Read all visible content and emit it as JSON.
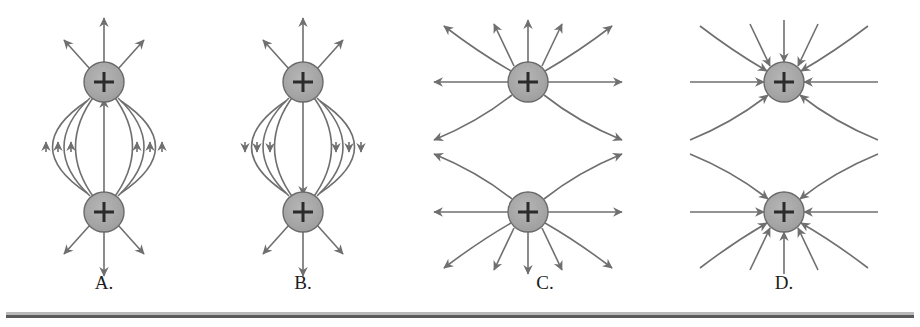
{
  "figure": {
    "background": "#ffffff",
    "line_color": "#6f6f6f",
    "charge_fill": "#a8a8a8",
    "charge_stroke": "#6a6a6a",
    "sign_color": "#2b2b2b",
    "label_color": "#1d1d1d",
    "rule_light_color": "#b9b9b9",
    "rule_dark_color": "#5a5a5a"
  },
  "panels": [
    {
      "id": "A",
      "label": "A.",
      "label_x": 104,
      "label_y": 272,
      "charge_sign": "+",
      "charges": [
        {
          "name": "upper-charge",
          "cx": 104,
          "cy": 82,
          "r": 20,
          "sign": "+"
        },
        {
          "name": "lower-charge",
          "cx": 104,
          "cy": 212,
          "r": 20,
          "sign": "+"
        }
      ],
      "pattern": "connected-arcs",
      "arc_count": 7,
      "middle_arrow_direction": "up",
      "pole_ray_count": 3,
      "top_pole_ray_direction": "outward-up",
      "bottom_pole_ray_direction": "outward-down",
      "description": "Curved arcs join the two charges; arrows along the arcs point upward."
    },
    {
      "id": "B",
      "label": "B.",
      "label_x": 303,
      "label_y": 272,
      "charge_sign": "+",
      "charges": [
        {
          "name": "upper-charge",
          "cx": 303,
          "cy": 82,
          "r": 20,
          "sign": "+"
        },
        {
          "name": "lower-charge",
          "cx": 303,
          "cy": 212,
          "r": 20,
          "sign": "+"
        }
      ],
      "pattern": "connected-arcs",
      "arc_count": 7,
      "middle_arrow_direction": "down",
      "pole_ray_count": 3,
      "top_pole_ray_direction": "outward-up",
      "bottom_pole_ray_direction": "outward-down",
      "description": "Curved arcs join the two charges; arrows along the arcs point downward."
    },
    {
      "id": "C",
      "label": "C.",
      "label_x": 545,
      "label_y": 272,
      "charge_sign": "+",
      "charges": [
        {
          "name": "upper-charge",
          "cx": 528,
          "cy": 82,
          "r": 20,
          "sign": "+"
        },
        {
          "name": "lower-charge",
          "cx": 528,
          "cy": 212,
          "r": 20,
          "sign": "+"
        }
      ],
      "pattern": "radiating-repulsion",
      "rays_per_charge": 10,
      "arrow_direction": "outward",
      "description": "Lines radiate outward from each charge and bend away from the neutral point between them."
    },
    {
      "id": "D",
      "label": "D.",
      "label_x": 784,
      "label_y": 272,
      "charge_sign": "+",
      "charges": [
        {
          "name": "upper-charge",
          "cx": 784,
          "cy": 82,
          "r": 20,
          "sign": "+"
        },
        {
          "name": "lower-charge",
          "cx": 784,
          "cy": 212,
          "r": 20,
          "sign": "+"
        }
      ],
      "pattern": "radiating-repulsion",
      "rays_per_charge": 10,
      "arrow_direction": "inward",
      "description": "Same geometry as C but every arrow points inward toward the charges."
    }
  ]
}
